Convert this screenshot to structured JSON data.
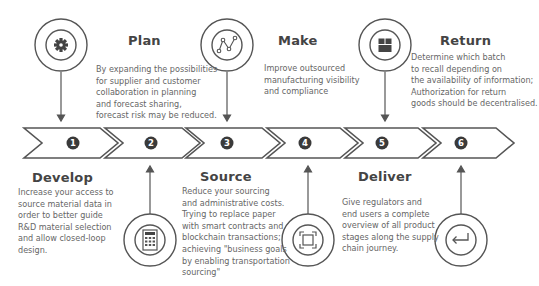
{
  "diagram": {
    "type": "process-flow",
    "colors": {
      "stroke": "#555555",
      "badge": "#3a3a3a",
      "badge_text": "#ffffff",
      "title": "#444444",
      "text": "#666666"
    },
    "steps": [
      {
        "number": "1",
        "title": "Develop",
        "icon": "gear-icon",
        "icon_position": "top",
        "description": "Increase your access to\nsource material data in\norder to better guide\nR&D material selection\nand allow closed-loop\ndesign."
      },
      {
        "number": "2",
        "title": "Plan",
        "icon": "calculator-icon",
        "icon_position": "bottom",
        "description": "By expanding the possibilities\nfor supplier and customer\ncollaboration in planning\nand forecast sharing,\nforecast risk may be reduced."
      },
      {
        "number": "3",
        "title": "Source",
        "icon": "line-graph-icon",
        "icon_position": "top",
        "description": "Reduce your sourcing\nand administrative costs.\nTrying to replace paper\nwith smart contracts and\nblockchain transactions;\nachieving \"business goals\nby enabling transportation\nsourcing\""
      },
      {
        "number": "4",
        "title": "Make",
        "icon": "scan-frame-icon",
        "icon_position": "bottom",
        "description": "Improve outsourced\nmanufacturing visibility\nand compliance"
      },
      {
        "number": "5",
        "title": "Deliver",
        "icon": "package-icon",
        "icon_position": "top",
        "description": "Give regulators and\nend users a complete\noverview of all product\nstages along the supply\nchain journey."
      },
      {
        "number": "6",
        "title": "Return",
        "icon": "return-arrow-icon",
        "icon_position": "bottom",
        "description": "Determine which batch\nto recall depending on\nthe availability of information;\nAuthorization for return\ngoods should be decentralised."
      }
    ]
  }
}
